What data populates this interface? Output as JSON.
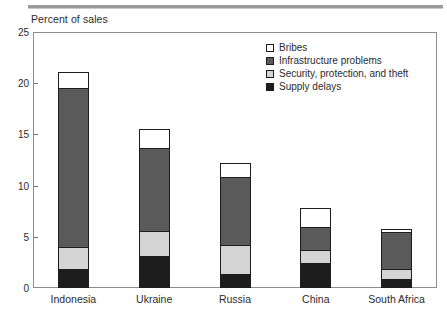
{
  "chart_data": {
    "type": "bar",
    "title": "",
    "subtitle": "",
    "ylabel": "Percent of sales",
    "xlabel": "",
    "ylim": [
      0,
      25
    ],
    "yticks": [
      0,
      5,
      10,
      15,
      20,
      25
    ],
    "ytick_labels": [
      "0",
      "5",
      "10",
      "15",
      "20",
      "25"
    ],
    "grid": false,
    "stacked": true,
    "legend_position": "top-right",
    "categories": [
      "Indonesia",
      "Ukraine",
      "Russia",
      "China",
      "South Africa"
    ],
    "series": [
      {
        "name": "Supply delays",
        "color": "#1d1d1d",
        "values": [
          1.8,
          3.0,
          1.3,
          2.3,
          0.8
        ]
      },
      {
        "name": "Security, protection, and theft",
        "color": "#d4d4d4",
        "values": [
          2.1,
          2.5,
          2.8,
          1.3,
          1.0
        ]
      },
      {
        "name": "Infrastructure problems",
        "color": "#5a5a5a",
        "values": [
          15.5,
          8.1,
          6.6,
          2.3,
          3.6
        ]
      },
      {
        "name": "Bribes",
        "color": "#ffffff",
        "values": [
          1.6,
          1.8,
          1.4,
          1.8,
          0.3
        ]
      }
    ],
    "totals": [
      21.0,
      15.4,
      12.1,
      7.7,
      5.7
    ],
    "legend_entries": [
      {
        "label": "Bribes",
        "color": "#ffffff"
      },
      {
        "label": "Infrastructure problems",
        "color": "#5a5a5a"
      },
      {
        "label": "Security, protection, and theft",
        "color": "#d4d4d4"
      },
      {
        "label": "Supply delays",
        "color": "#1d1d1d"
      }
    ]
  },
  "axis": {
    "y_title": "Percent of sales"
  },
  "colors": {
    "frame": "#8d8d8d",
    "rule": "#9a9a9a",
    "text": "#2b2b2b",
    "outline": "#1d1d1d"
  }
}
